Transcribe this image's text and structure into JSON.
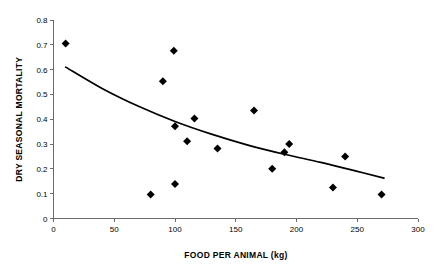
{
  "chart_data": {
    "type": "scatter",
    "title": "",
    "xlabel": "FOOD PER ANIMAL (kg)",
    "ylabel": "DRY SEASONAL MORTALITY",
    "xlim": [
      0,
      300
    ],
    "ylim": [
      0,
      0.8
    ],
    "grid": false,
    "legend": "none",
    "xticks": [
      0,
      50,
      100,
      150,
      200,
      250,
      300
    ],
    "xtick_labels": [
      "0",
      "50",
      "100",
      "150",
      "200",
      "250",
      "300"
    ],
    "yticks": [
      0,
      0.1,
      0.2,
      0.3,
      0.4,
      0.5,
      0.6,
      0.7,
      0.8
    ],
    "ytick_labels": [
      "0",
      "0.1",
      "0.2",
      "0.3",
      "0.4",
      "0.5",
      "0.6",
      "0.7",
      "0.8"
    ],
    "marker": "diamond",
    "marker_color": "#000000",
    "points": [
      {
        "x": 10,
        "y": 0.705
      },
      {
        "x": 80,
        "y": 0.097
      },
      {
        "x": 90,
        "y": 0.553
      },
      {
        "x": 99,
        "y": 0.676
      },
      {
        "x": 100,
        "y": 0.372
      },
      {
        "x": 100,
        "y": 0.139
      },
      {
        "x": 110,
        "y": 0.311
      },
      {
        "x": 116,
        "y": 0.403
      },
      {
        "x": 135,
        "y": 0.282
      },
      {
        "x": 165,
        "y": 0.435
      },
      {
        "x": 180,
        "y": 0.201
      },
      {
        "x": 190,
        "y": 0.267
      },
      {
        "x": 194,
        "y": 0.3
      },
      {
        "x": 230,
        "y": 0.125
      },
      {
        "x": 240,
        "y": 0.25
      },
      {
        "x": 270,
        "y": 0.097
      }
    ],
    "trend": {
      "kind": "exponential-decay",
      "stroke_color": "#000000",
      "x_start": 10,
      "x_end": 272,
      "y_start": 0.61,
      "y_end": 0.163,
      "curve_points": [
        {
          "x": 10,
          "y": 0.61
        },
        {
          "x": 40,
          "y": 0.524
        },
        {
          "x": 70,
          "y": 0.452
        },
        {
          "x": 100,
          "y": 0.391
        },
        {
          "x": 130,
          "y": 0.34
        },
        {
          "x": 160,
          "y": 0.296
        },
        {
          "x": 190,
          "y": 0.259
        },
        {
          "x": 220,
          "y": 0.226
        },
        {
          "x": 250,
          "y": 0.19
        },
        {
          "x": 272,
          "y": 0.163
        }
      ]
    }
  }
}
